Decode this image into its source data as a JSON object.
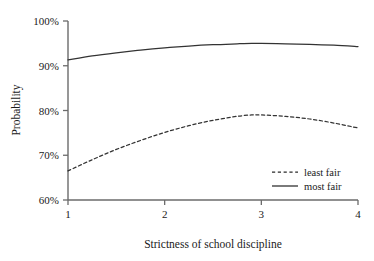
{
  "chart_data": {
    "type": "line",
    "title": "",
    "subtitle": "",
    "xlabel": "Strictness of school discipline",
    "ylabel": "Probability",
    "xlim": [
      1,
      4
    ],
    "ylim": [
      60,
      100
    ],
    "xticks": [
      1,
      2,
      3,
      4
    ],
    "xtick_labels": [
      "1",
      "2",
      "3",
      "4"
    ],
    "yticks": [
      60,
      70,
      80,
      90,
      100
    ],
    "ytick_labels": [
      "60%",
      "70%",
      "80%",
      "90%",
      "100%"
    ],
    "grid": false,
    "legend_position": "lower right",
    "y_unit": "percent",
    "series": [
      {
        "name": "least fair",
        "style": "dashed",
        "color": "#333333",
        "x": [
          1.0,
          1.25,
          1.5,
          1.75,
          2.0,
          2.25,
          2.5,
          2.75,
          2.9,
          3.0,
          3.25,
          3.5,
          3.75,
          4.0
        ],
        "values": [
          66.5,
          69.0,
          71.3,
          73.3,
          75.1,
          76.6,
          77.8,
          78.7,
          79.0,
          79.0,
          78.7,
          78.1,
          77.2,
          76.1
        ]
      },
      {
        "name": "most fair",
        "style": "solid",
        "color": "#333333",
        "x": [
          1.0,
          1.25,
          1.5,
          1.75,
          2.0,
          2.25,
          2.5,
          2.75,
          2.9,
          3.0,
          3.25,
          3.5,
          3.75,
          4.0
        ],
        "values": [
          91.3,
          92.2,
          92.9,
          93.5,
          94.0,
          94.4,
          94.7,
          94.9,
          95.0,
          95.0,
          94.9,
          94.8,
          94.6,
          94.3
        ]
      }
    ]
  },
  "legend": {
    "entries": [
      {
        "label": "least fair",
        "style": "dashed"
      },
      {
        "label": "most fair",
        "style": "solid"
      }
    ]
  },
  "axes": {
    "y_title": "Probability",
    "x_title": "Strictness of school discipline",
    "y_labels": [
      "100%",
      "90%",
      "80%",
      "70%",
      "60%"
    ],
    "x_labels": [
      "1",
      "2",
      "3",
      "4"
    ]
  },
  "colors": {
    "axis": "#6b6b6b",
    "line": "#2a2a2a",
    "text": "#1a1a1a",
    "background": "#ffffff"
  }
}
